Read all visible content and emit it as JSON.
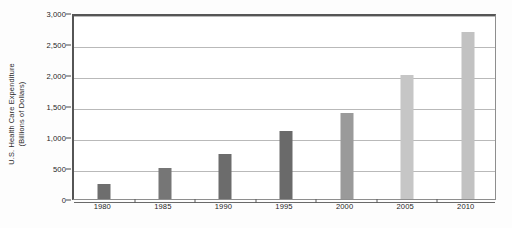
{
  "chart_data": {
    "type": "bar",
    "title": "",
    "xlabel": "",
    "ylabel_line1": "U.S. Health Care Expenditure",
    "ylabel_line2": "(Billions of Dollars)",
    "categories": [
      "1980",
      "1985",
      "1990",
      "1995",
      "2000",
      "2005",
      "2010"
    ],
    "values": [
      250,
      500,
      720,
      1100,
      1380,
      2000,
      2700
    ],
    "bar_colors": [
      "#6e6e6e",
      "#767676",
      "#6c6c6c",
      "#6a6a6a",
      "#9a9a9a",
      "#c6c6c6",
      "#c2c2c2"
    ],
    "ylim": [
      0,
      3000
    ],
    "ytick_values": [
      0,
      500,
      1000,
      1500,
      2000,
      2500,
      3000
    ],
    "ytick_labels": [
      "0",
      "500",
      "1,000",
      "1,500",
      "2,000",
      "2,500",
      "3,000"
    ],
    "grid": true,
    "legend": "none",
    "series": [
      {
        "name": "U.S. Health Care Expenditure",
        "values": [
          250,
          500,
          720,
          1100,
          1380,
          2000,
          2700
        ]
      }
    ]
  },
  "colors": {
    "background": "#fdfdfd",
    "plot_background": "#ffffff",
    "gridline": "#b9b9b9",
    "frame": "#555555",
    "text": "#1e1e1e"
  }
}
